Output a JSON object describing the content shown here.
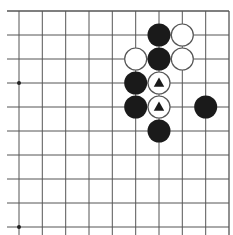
{
  "board": {
    "description": "Partial Go board diagram (top-right region visible)",
    "line_color": "#555555",
    "black_stone_color": "#1a1a1a",
    "white_stone_color": "#ffffff",
    "white_stone_border": "#555555",
    "marker_color": "#1a1a1a",
    "columns_visible": 10,
    "rows_visible": 10,
    "edges": {
      "top": true,
      "right": true,
      "left": false,
      "bottom": false
    },
    "star_points": [
      {
        "col": 0,
        "row": 3
      },
      {
        "col": 0,
        "row": 9
      }
    ],
    "stones": [
      {
        "col": 6,
        "row": 1,
        "color": "black",
        "marker": null
      },
      {
        "col": 7,
        "row": 1,
        "color": "white",
        "marker": null
      },
      {
        "col": 5,
        "row": 2,
        "color": "white",
        "marker": null
      },
      {
        "col": 6,
        "row": 2,
        "color": "black",
        "marker": null
      },
      {
        "col": 7,
        "row": 2,
        "color": "white",
        "marker": null
      },
      {
        "col": 5,
        "row": 3,
        "color": "black",
        "marker": null
      },
      {
        "col": 6,
        "row": 3,
        "color": "white",
        "marker": "triangle"
      },
      {
        "col": 5,
        "row": 4,
        "color": "black",
        "marker": null
      },
      {
        "col": 6,
        "row": 4,
        "color": "white",
        "marker": "triangle"
      },
      {
        "col": 8,
        "row": 4,
        "color": "black",
        "marker": null
      },
      {
        "col": 6,
        "row": 5,
        "color": "black",
        "marker": null
      }
    ]
  }
}
